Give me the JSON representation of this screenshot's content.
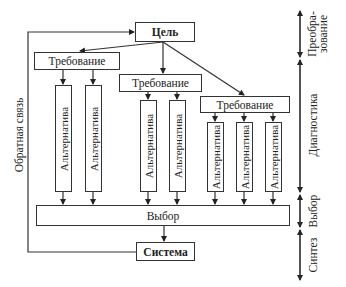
{
  "diagram": {
    "goal": "Цель",
    "requirements": [
      "Требование",
      "Требование",
      "Требование"
    ],
    "alternatives": {
      "group1": [
        "Альтернатива",
        "Альтернатива"
      ],
      "group2": [
        "Альтернатива",
        "Альтернатива"
      ],
      "group3": [
        "Альтернатива",
        "Альтернатива",
        "Альтернатива"
      ]
    },
    "choice": "Выбор",
    "system": "Система",
    "feedback": "Обратная связь"
  },
  "stages": {
    "transformation_line1": "Преобра-",
    "transformation_line2": "зование",
    "diagnostics": "Диагностика",
    "choice": "Выбор",
    "synthesis": "Синтез"
  }
}
